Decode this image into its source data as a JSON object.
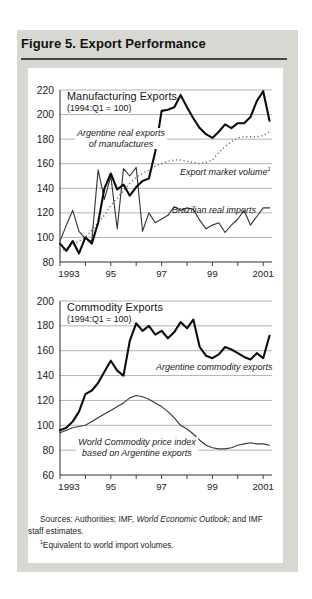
{
  "figure": {
    "title": "Figure 5. Export Performance"
  },
  "chart_data": [
    {
      "type": "line",
      "title": "Manufacturing Exports",
      "subtitle": "(1994:Q1 = 100)",
      "x_unit": "quarterly",
      "x_start": 1993.0,
      "x_end": 2001.25,
      "x_tick_labels": [
        "1993",
        "95",
        "97",
        "99",
        "2001"
      ],
      "ylim": [
        80,
        220
      ],
      "y_step": 20,
      "grid": true,
      "legend_position": "inline-annotations",
      "series": [
        {
          "name": "Argentine real exports of manufactures",
          "style": "thick-solid",
          "values": [
            95,
            89,
            97,
            87,
            100,
            95,
            112,
            140,
            152,
            139,
            143,
            134,
            141,
            146,
            148,
            170,
            203,
            204,
            206,
            216,
            206,
            197,
            189,
            184,
            181,
            186,
            192,
            189,
            193,
            193,
            198,
            211,
            219,
            195
          ]
        },
        {
          "name": "Export market volume",
          "style": "dotted",
          "values": [
            88,
            91,
            94,
            97,
            100,
            106,
            112,
            118,
            126,
            132,
            138,
            144,
            149,
            152,
            155,
            158,
            160,
            162,
            163,
            163,
            162,
            161,
            160,
            161,
            163,
            169,
            174,
            178,
            181,
            182,
            182,
            182,
            183,
            186
          ]
        },
        {
          "name": "Brazilian real imports",
          "style": "thin-solid",
          "values": [
            97,
            110,
            122,
            105,
            99,
            97,
            155,
            131,
            150,
            107,
            156,
            150,
            157,
            105,
            120,
            112,
            115,
            118,
            125,
            122,
            124,
            123,
            114,
            107,
            110,
            112,
            104,
            110,
            115,
            122,
            110,
            117,
            124,
            124
          ]
        }
      ],
      "annotations": {
        "series1_line1": "Argentine real exports",
        "series1_line2": "of manufactures",
        "series2": "Export market volume",
        "series2_sup": "1",
        "series3": "Brazilian real imports"
      }
    },
    {
      "type": "line",
      "title": "Commodity Exports",
      "subtitle": "(1994:Q1 = 100)",
      "x_unit": "quarterly",
      "x_start": 1993.0,
      "x_end": 2001.25,
      "x_tick_labels": [
        "1993",
        "95",
        "97",
        "99",
        "2001"
      ],
      "ylim": [
        60,
        200
      ],
      "y_step": 20,
      "grid": true,
      "legend_position": "inline-annotations",
      "series": [
        {
          "name": "Argentine commodity exports",
          "style": "thick-solid",
          "values": [
            96,
            98,
            103,
            111,
            125,
            128,
            134,
            143,
            152,
            144,
            140,
            168,
            182,
            176,
            180,
            173,
            176,
            170,
            175,
            183,
            178,
            185,
            163,
            156,
            154,
            157,
            163,
            161,
            158,
            155,
            153,
            158,
            154,
            172
          ]
        },
        {
          "name": "World Commodity price index based on Argentine exports",
          "style": "thin-solid",
          "values": [
            94,
            96,
            98,
            99,
            100,
            103,
            106,
            109,
            112,
            115,
            118,
            122,
            124,
            123,
            121,
            118,
            115,
            111,
            106,
            100,
            97,
            93,
            88,
            84,
            82,
            81,
            81,
            82,
            84,
            85,
            86,
            85,
            85,
            84
          ]
        }
      ],
      "annotations": {
        "series1": "Argentine commodity exports",
        "series2_line1": "World Commodity price index",
        "series2_line2": "based on Argentine exports"
      }
    }
  ],
  "colors": {
    "panel_background": "#d8d7d2",
    "card_background": "#ffffff",
    "thick_line": "#0d0d0d",
    "thin_line": "#383838",
    "dotted_line": "#666666",
    "gridline": "#9a9a9a",
    "axis": "#2b2b2b"
  },
  "footer": {
    "sources_prefix": "Sources: Authorities; IMF, ",
    "sources_italic": "World Economic Outlook;",
    "sources_suffix": " and IMF staff estimates.",
    "footnote_sup": "1",
    "footnote_text": "Equivalent to world import volumes."
  }
}
